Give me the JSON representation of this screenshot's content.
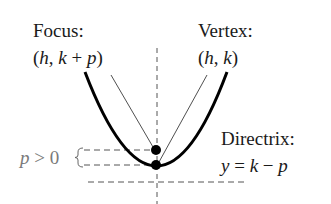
{
  "diagram": {
    "labels": {
      "focus_title": "Focus:",
      "focus_coord_open": "(",
      "focus_h": "h",
      "focus_sep": ", ",
      "focus_k": "k",
      "focus_plus": " + ",
      "focus_p": "p",
      "focus_close": ")",
      "vertex_title": "Vertex:",
      "vertex_coord_open": "(",
      "vertex_h": "h",
      "vertex_sep": ", ",
      "vertex_k": "k",
      "vertex_close": ")",
      "directrix_title": "Directrix:",
      "directrix_y": "y",
      "directrix_eq": " = ",
      "directrix_k": "k",
      "directrix_minus": " − ",
      "directrix_p": "p",
      "p_condition_p": "p",
      "p_condition_rest": " > 0"
    },
    "elements": {
      "parabola": "opens upward, thick black curve",
      "focus_point": "filled black dot above vertex",
      "vertex_point": "filled black dot at bottom of parabola",
      "axis_of_symmetry": "vertical dashed line",
      "directrix_line": "horizontal dashed line below vertex",
      "p_brace": "left curly brace marking distance p between focus and vertex"
    },
    "colors": {
      "curve": "#000000",
      "dashes": "#555555",
      "label_text": "#1a1a1a",
      "condition_text": "#7a7a7a"
    }
  }
}
